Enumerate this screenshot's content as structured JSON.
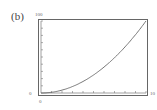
{
  "panel_label": "(b)",
  "chart_data": {
    "type": "line",
    "title": "",
    "xlabel": "",
    "ylabel": "",
    "xlim": [
      0,
      10
    ],
    "ylim": [
      0,
      100
    ],
    "x_tick_labels": {
      "min": "0",
      "max": "10"
    },
    "y_tick_labels": {
      "min": "0",
      "max": "100"
    },
    "x_ticks": 10,
    "y_ticks": 10,
    "grid": false,
    "series": [
      {
        "name": "curve",
        "x": [
          0,
          1,
          2,
          3,
          4,
          5,
          6,
          7,
          8,
          9,
          10
        ],
        "y": [
          0,
          1,
          4,
          9,
          16,
          25,
          36,
          49,
          64,
          81,
          100
        ]
      }
    ]
  }
}
